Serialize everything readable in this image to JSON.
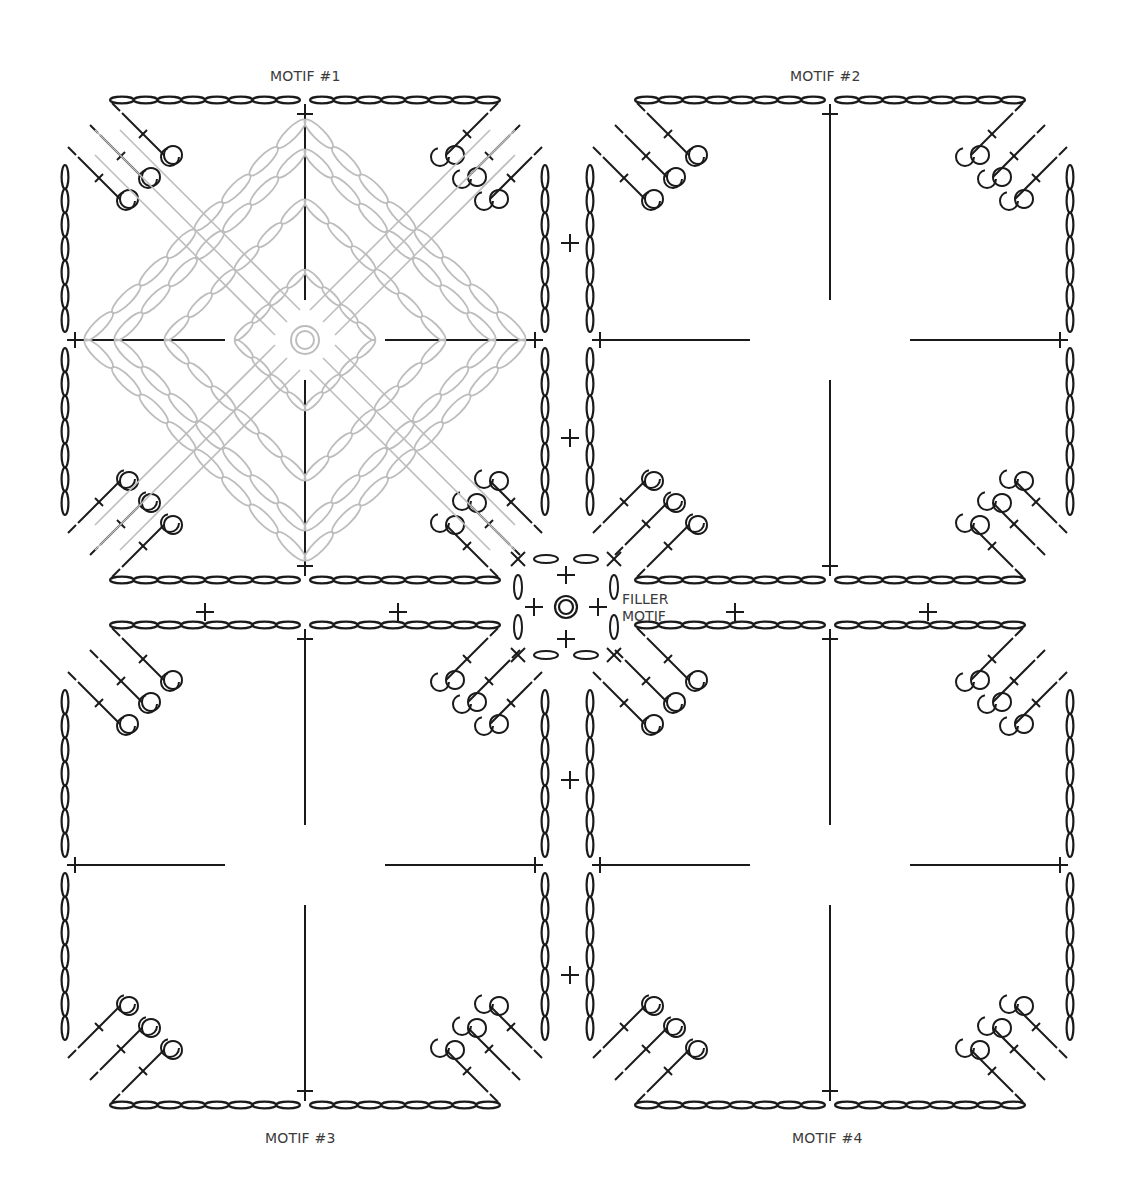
{
  "diagram": {
    "colors": {
      "ink": "#1a1a1a",
      "faded": "#bdbdbd",
      "arrow": "#7a7a7a",
      "label": "#3a3a3a"
    },
    "motifs": [
      {
        "id": "motif-1",
        "label": "MOTIF #1",
        "x": 65,
        "y": 100,
        "size": 480,
        "label_x": 270,
        "label_y": 68,
        "start_corner": "top-left",
        "row_label": "5",
        "show_inner_rounds": true
      },
      {
        "id": "motif-2",
        "label": "MOTIF #2",
        "x": 590,
        "y": 100,
        "size": 480,
        "label_x": 790,
        "label_y": 68,
        "start_corner": "top-left-lower",
        "row_label": "5",
        "show_inner_rounds": false
      },
      {
        "id": "motif-3",
        "label": "MOTIF #3",
        "x": 65,
        "y": 625,
        "size": 480,
        "label_x": 265,
        "label_y": 1130,
        "start_corner": "top-left-lower",
        "row_label": "5",
        "show_inner_rounds": false
      },
      {
        "id": "motif-4",
        "label": "MOTIF #4",
        "x": 590,
        "y": 625,
        "size": 480,
        "label_x": 792,
        "label_y": 1130,
        "start_corner": "bottom-left",
        "row_label": "5",
        "show_inner_rounds": false
      }
    ],
    "filler": {
      "label_line1": "FILLER",
      "label_line2": "MOTIF",
      "cx": 566,
      "cy": 607
    },
    "inner_round_labels": [
      "1",
      "2",
      "3",
      "4"
    ]
  }
}
